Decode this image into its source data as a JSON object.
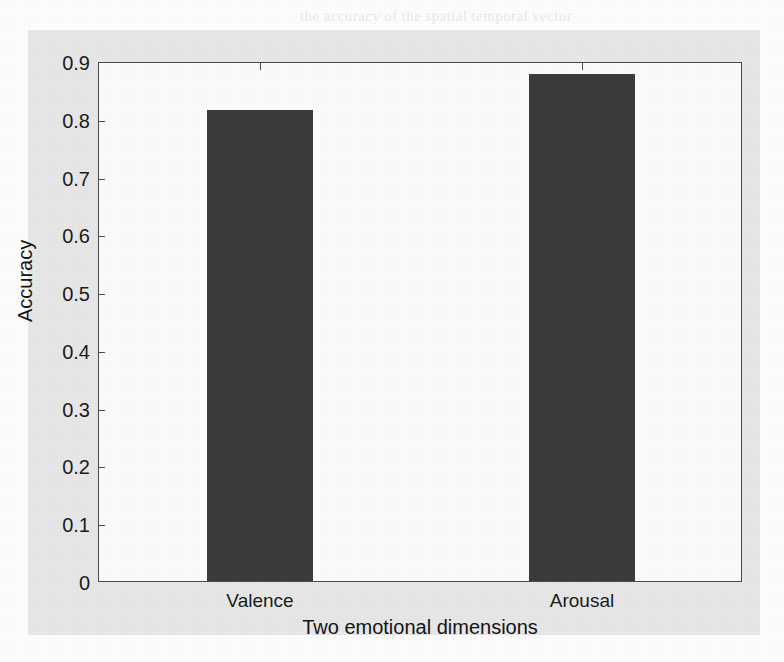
{
  "figure": {
    "background_color": "#e7e7e7",
    "plot_background_color": "#fbfbfb",
    "axis_color": "#4a4a4a",
    "bar_color": "#3b3b3b"
  },
  "bleed_text": [
    {
      "text": "the accuracy of the spatial temporal vector",
      "x": 300,
      "y": 8
    },
    {
      "text": "shortcut. We investigate a Compare them",
      "x": 330,
      "y": 32
    },
    {
      "text": "with different conv-filter and arousal layer. The",
      "x": 350,
      "y": 56
    },
    {
      "text": "is proposed on Wang and Li, and Xu, Cong",
      "x": 330,
      "y": 80
    },
    {
      "text": "a dimension labeling, and the CNN experimen",
      "x": 340,
      "y": 104
    },
    {
      "text": "in recognition.",
      "x": 330,
      "y": 128
    },
    {
      "text": "results and Discussion",
      "x": 320,
      "y": 184
    },
    {
      "text": "summary of the multi-modal emotion recognition and the",
      "x": 310,
      "y": 216
    },
    {
      "text": "of two features of feature fusion. The Results are listed",
      "x": 330,
      "y": 240
    },
    {
      "text": "in the confusion outputs of the valence or Fig. 2 are in the",
      "x": 300,
      "y": 264
    },
    {
      "text": "Fig. 2 and Fig. 3 samples of the equations for all the",
      "x": 330,
      "y": 288
    },
    {
      "text": "emotional dimensions. The recognition results of the accuracy",
      "x": 310,
      "y": 312
    },
    {
      "text": "shown in Fig. 2 and Fig. 3 respectively",
      "x": 330,
      "y": 336
    }
  ],
  "chart_data": {
    "type": "bar",
    "title": "",
    "xlabel": "Two emotional dimensions",
    "ylabel": "Accuracy",
    "categories": [
      "Valence",
      "Arousal"
    ],
    "values": [
      0.815,
      0.878
    ],
    "ylim": [
      0,
      0.9
    ],
    "ytick_labels": [
      "0",
      "0.1",
      "0.2",
      "0.3",
      "0.4",
      "0.5",
      "0.6",
      "0.7",
      "0.8",
      "0.9"
    ],
    "ytick_values": [
      0,
      0.1,
      0.2,
      0.3,
      0.4,
      0.5,
      0.6,
      0.7,
      0.8,
      0.9
    ],
    "grid": false,
    "legend": null,
    "bar_color": "#3b3b3b",
    "bar_width_fraction": 0.33
  }
}
